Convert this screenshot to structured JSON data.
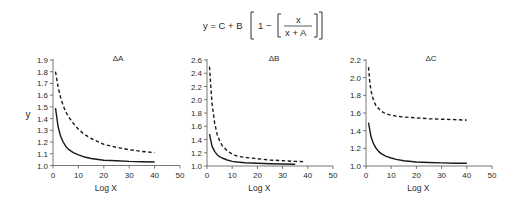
{
  "equation": {
    "lhs": "y = C + B",
    "one": "1 −",
    "numerator": "x",
    "denominator": "x + A"
  },
  "chart_data": [
    {
      "type": "line",
      "title": "ΔA",
      "xlabel": "Log X",
      "ylabel": "y",
      "xlim": [
        0,
        50
      ],
      "ylim": [
        1.0,
        1.9
      ],
      "xticks": [
        0,
        10,
        20,
        30,
        40,
        50
      ],
      "yticks": [
        1.0,
        1.1,
        1.2,
        1.3,
        1.4,
        1.5,
        1.6,
        1.7,
        1.8,
        1.9
      ],
      "ytick_labels": [
        "1.0",
        "1.1",
        "1.2",
        "1.3",
        "1.4",
        "1.5",
        "1.6",
        "1.7",
        "1.8",
        "1.9"
      ],
      "grid": false,
      "series": [
        {
          "name": "solid",
          "style": "solid",
          "x": [
            1,
            2,
            3,
            4,
            5,
            6,
            8,
            10,
            12,
            15,
            20,
            25,
            30,
            35,
            40
          ],
          "y": [
            1.49,
            1.33,
            1.25,
            1.2,
            1.165,
            1.14,
            1.11,
            1.09,
            1.075,
            1.06,
            1.045,
            1.04,
            1.035,
            1.032,
            1.03
          ]
        },
        {
          "name": "dashed",
          "style": "dashed",
          "x": [
            1,
            2,
            3,
            4,
            5,
            6,
            8,
            10,
            12,
            15,
            20,
            25,
            30,
            35,
            40
          ],
          "y": [
            1.8,
            1.67,
            1.58,
            1.51,
            1.46,
            1.42,
            1.36,
            1.31,
            1.27,
            1.23,
            1.18,
            1.155,
            1.135,
            1.12,
            1.11
          ]
        }
      ]
    },
    {
      "type": "line",
      "title": "ΔB",
      "xlabel": "Log X",
      "ylabel": "",
      "xlim": [
        0,
        50
      ],
      "ylim": [
        1.0,
        2.6
      ],
      "xticks": [
        0,
        10,
        20,
        30,
        40,
        50
      ],
      "yticks": [
        1.0,
        1.2,
        1.4,
        1.6,
        1.8,
        2.0,
        2.2,
        2.4,
        2.6
      ],
      "ytick_labels": [
        "1.0",
        "1.2",
        "1.4",
        "1.6",
        "1.8",
        "2.0",
        "2.2",
        "2.4",
        "2.6"
      ],
      "grid": false,
      "series": [
        {
          "name": "solid",
          "style": "solid",
          "x": [
            1,
            2,
            3,
            4,
            5,
            6,
            8,
            10,
            12,
            15,
            20,
            25,
            30,
            35
          ],
          "y": [
            1.48,
            1.3,
            1.22,
            1.17,
            1.14,
            1.12,
            1.09,
            1.07,
            1.06,
            1.05,
            1.04,
            1.035,
            1.03,
            1.025
          ]
        },
        {
          "name": "dashed",
          "style": "dashed",
          "x": [
            1,
            1.5,
            2,
            3,
            4,
            5,
            6,
            8,
            10,
            12,
            15,
            20,
            25,
            30,
            35,
            39
          ],
          "y": [
            2.5,
            2.2,
            1.95,
            1.65,
            1.48,
            1.38,
            1.31,
            1.23,
            1.18,
            1.15,
            1.13,
            1.11,
            1.09,
            1.08,
            1.07,
            1.065
          ]
        }
      ]
    },
    {
      "type": "line",
      "title": "ΔC",
      "xlabel": "Log X",
      "ylabel": "",
      "xlim": [
        0,
        50
      ],
      "ylim": [
        1.0,
        2.2
      ],
      "xticks": [
        0,
        10,
        20,
        30,
        40,
        50
      ],
      "yticks": [
        1.0,
        1.2,
        1.4,
        1.6,
        1.8,
        2.0,
        2.2
      ],
      "ytick_labels": [
        "1.0",
        "1.2",
        "1.4",
        "1.6",
        "1.8",
        "2.0",
        "2.2"
      ],
      "grid": false,
      "series": [
        {
          "name": "solid",
          "style": "solid",
          "x": [
            1,
            2,
            3,
            4,
            5,
            6,
            8,
            10,
            12,
            15,
            20,
            25,
            30,
            35,
            40
          ],
          "y": [
            1.49,
            1.33,
            1.25,
            1.2,
            1.165,
            1.14,
            1.11,
            1.09,
            1.075,
            1.06,
            1.045,
            1.04,
            1.035,
            1.032,
            1.03
          ]
        },
        {
          "name": "dashed",
          "style": "dashed",
          "x": [
            1,
            1.5,
            2,
            3,
            4,
            5,
            6,
            8,
            10,
            12,
            15,
            20,
            25,
            30,
            35,
            40
          ],
          "y": [
            2.12,
            1.95,
            1.85,
            1.74,
            1.68,
            1.65,
            1.62,
            1.59,
            1.575,
            1.565,
            1.555,
            1.545,
            1.535,
            1.53,
            1.525,
            1.52
          ]
        }
      ]
    }
  ],
  "layout": {
    "panels": [
      {
        "x0": 53,
        "x50": 180,
        "ybottom": 165.5,
        "ytop": 60,
        "title_x": 118,
        "ylabel_x": 28,
        "ylabel_y": 118
      },
      {
        "x0": 207,
        "x50": 333,
        "ybottom": 166,
        "ytop": 60,
        "title_x": 274,
        "ylabel_x": null,
        "ylabel_y": null
      },
      {
        "x0": 366,
        "x50": 492,
        "ybottom": 166,
        "ytop": 60,
        "title_x": 431,
        "ylabel_x": null,
        "ylabel_y": null
      }
    ],
    "line_color": "#1a1a1a",
    "axis_color": "#555555"
  }
}
